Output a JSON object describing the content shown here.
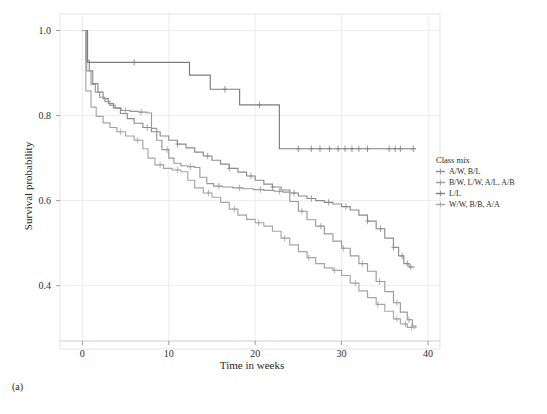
{
  "panel": {
    "label": "(a)"
  },
  "chart_data": {
    "type": "line",
    "subtype": "kaplan-meier-survival-step",
    "title": "",
    "xlabel": "Time in weeks",
    "ylabel": "Survival probability",
    "xlim": [
      -1.2,
      40
    ],
    "ylim": [
      0.27,
      1.02
    ],
    "xticks": [
      0,
      10,
      20,
      30,
      40
    ],
    "xtick_labels": [
      "0",
      "10",
      "20",
      "30",
      "40"
    ],
    "yticks": [
      0.4,
      0.6,
      0.8,
      1.0
    ],
    "ytick_labels": [
      "0.4",
      "0.6",
      "0.8",
      "1.0"
    ],
    "grid": true,
    "grid_color": "#e9e9ea",
    "legend_position": "right-outside",
    "legend_title": "Class mix",
    "series": [
      {
        "name": "A/W, B/L",
        "color": "#8c8c8c",
        "points": [
          [
            0,
            1.0
          ],
          [
            0.4,
            0.93
          ],
          [
            0.8,
            0.905
          ],
          [
            1.2,
            0.875
          ],
          [
            1.8,
            0.855
          ],
          [
            2.4,
            0.84
          ],
          [
            3.0,
            0.828
          ],
          [
            3.6,
            0.818
          ],
          [
            4.4,
            0.805
          ],
          [
            5.2,
            0.793
          ],
          [
            6.0,
            0.782
          ],
          [
            7.0,
            0.772
          ],
          [
            8.0,
            0.762
          ],
          [
            9.0,
            0.752
          ],
          [
            10.0,
            0.742
          ],
          [
            11.0,
            0.733
          ],
          [
            12.0,
            0.724
          ],
          [
            13.0,
            0.714
          ],
          [
            14.0,
            0.705
          ],
          [
            15.0,
            0.695
          ],
          [
            16.0,
            0.686
          ],
          [
            17.0,
            0.676
          ],
          [
            18.0,
            0.667
          ],
          [
            19.0,
            0.658
          ],
          [
            20.0,
            0.648
          ],
          [
            21.0,
            0.639
          ],
          [
            22.0,
            0.632
          ],
          [
            23.0,
            0.625
          ],
          [
            24.0,
            0.618
          ],
          [
            25.0,
            0.611
          ],
          [
            26.0,
            0.605
          ],
          [
            27.0,
            0.6
          ],
          [
            28.0,
            0.596
          ],
          [
            29.0,
            0.592
          ],
          [
            30.0,
            0.586
          ],
          [
            31.0,
            0.578
          ],
          [
            32.0,
            0.566
          ],
          [
            33.0,
            0.552
          ],
          [
            34.0,
            0.534
          ],
          [
            35.0,
            0.512
          ],
          [
            36.0,
            0.49
          ],
          [
            36.6,
            0.47
          ],
          [
            37.2,
            0.452
          ],
          [
            37.8,
            0.444
          ],
          [
            38.4,
            0.443
          ]
        ],
        "censor_times": [
          7.5,
          11.0,
          14.5,
          17.0,
          19.5,
          22.0,
          24.5,
          26.5,
          28.5,
          30.5,
          33.0,
          34.5,
          36.0,
          37.0,
          37.6,
          38.0
        ]
      },
      {
        "name": "B/W, L/W, A/L, A/B",
        "color": "#9a9a9a",
        "points": [
          [
            0,
            1.0
          ],
          [
            0.5,
            0.905
          ],
          [
            1.0,
            0.873
          ],
          [
            1.5,
            0.855
          ],
          [
            2.0,
            0.843
          ],
          [
            2.6,
            0.833
          ],
          [
            3.2,
            0.824
          ],
          [
            3.8,
            0.817
          ],
          [
            4.5,
            0.812
          ],
          [
            5.5,
            0.81
          ],
          [
            6.5,
            0.808
          ],
          [
            7.5,
            0.806
          ],
          [
            8.0,
            0.77
          ],
          [
            8.6,
            0.742
          ],
          [
            9.2,
            0.72
          ],
          [
            10.0,
            0.7
          ],
          [
            10.6,
            0.688
          ],
          [
            11.4,
            0.682
          ],
          [
            12.2,
            0.68
          ],
          [
            13.0,
            0.678
          ],
          [
            13.6,
            0.655
          ],
          [
            14.4,
            0.64
          ],
          [
            15.2,
            0.634
          ],
          [
            16.2,
            0.632
          ],
          [
            17.4,
            0.63
          ],
          [
            18.6,
            0.628
          ],
          [
            19.8,
            0.626
          ],
          [
            21.0,
            0.624
          ],
          [
            22.2,
            0.622
          ],
          [
            23.2,
            0.62
          ],
          [
            24.0,
            0.598
          ],
          [
            25.0,
            0.575
          ],
          [
            26.0,
            0.555
          ],
          [
            27.0,
            0.54
          ],
          [
            28.0,
            0.522
          ],
          [
            29.0,
            0.505
          ],
          [
            30.0,
            0.488
          ],
          [
            31.0,
            0.47
          ],
          [
            32.0,
            0.452
          ],
          [
            33.0,
            0.434
          ],
          [
            34.0,
            0.41
          ],
          [
            35.0,
            0.386
          ],
          [
            36.0,
            0.36
          ],
          [
            36.8,
            0.338
          ],
          [
            37.6,
            0.32
          ],
          [
            38.2,
            0.305
          ],
          [
            38.6,
            0.3
          ]
        ],
        "censor_times": [
          5.0,
          6.8,
          9.8,
          12.5,
          15.8,
          18.2,
          20.6,
          22.8,
          25.4,
          27.6,
          30.2,
          32.4,
          34.4,
          36.4,
          37.8
        ]
      },
      {
        "name": "L/L",
        "color": "#7d7d7d",
        "points": [
          [
            0,
            1.0
          ],
          [
            0.6,
            0.925
          ],
          [
            12.0,
            0.925
          ],
          [
            12.4,
            0.895
          ],
          [
            14.4,
            0.895
          ],
          [
            14.8,
            0.862
          ],
          [
            17.8,
            0.862
          ],
          [
            18.2,
            0.825
          ],
          [
            22.4,
            0.825
          ],
          [
            22.8,
            0.722
          ],
          [
            38.6,
            0.722
          ]
        ],
        "censor_times": [
          6.0,
          16.5,
          20.5,
          25.0,
          26.5,
          27.5,
          28.6,
          29.6,
          30.4,
          31.2,
          32.0,
          33.0,
          35.5,
          36.2,
          36.8,
          38.3
        ]
      },
      {
        "name": "W/W, B/B, A/A",
        "color": "#a5a5a5",
        "points": [
          [
            0,
            1.0
          ],
          [
            0.4,
            0.858
          ],
          [
            1.0,
            0.82
          ],
          [
            1.6,
            0.798
          ],
          [
            2.4,
            0.783
          ],
          [
            3.2,
            0.772
          ],
          [
            4.0,
            0.762
          ],
          [
            5.0,
            0.752
          ],
          [
            6.0,
            0.742
          ],
          [
            7.0,
            0.722
          ],
          [
            7.6,
            0.7
          ],
          [
            8.4,
            0.684
          ],
          [
            9.4,
            0.676
          ],
          [
            10.4,
            0.672
          ],
          [
            11.4,
            0.668
          ],
          [
            12.2,
            0.648
          ],
          [
            13.0,
            0.63
          ],
          [
            14.0,
            0.618
          ],
          [
            15.0,
            0.608
          ],
          [
            16.0,
            0.596
          ],
          [
            17.0,
            0.58
          ],
          [
            18.0,
            0.566
          ],
          [
            19.0,
            0.556
          ],
          [
            20.0,
            0.548
          ],
          [
            21.0,
            0.54
          ],
          [
            22.0,
            0.528
          ],
          [
            23.0,
            0.512
          ],
          [
            24.0,
            0.496
          ],
          [
            25.0,
            0.48
          ],
          [
            26.0,
            0.466
          ],
          [
            27.0,
            0.452
          ],
          [
            28.0,
            0.442
          ],
          [
            29.0,
            0.436
          ],
          [
            30.0,
            0.424
          ],
          [
            31.0,
            0.406
          ],
          [
            32.0,
            0.388
          ],
          [
            33.0,
            0.372
          ],
          [
            34.0,
            0.356
          ],
          [
            35.0,
            0.34
          ],
          [
            36.0,
            0.322
          ],
          [
            36.8,
            0.31
          ],
          [
            37.6,
            0.302
          ],
          [
            38.4,
            0.298
          ]
        ],
        "censor_times": [
          4.4,
          6.4,
          9.0,
          11.0,
          14.6,
          17.6,
          20.4,
          23.4,
          26.2,
          29.2,
          31.6,
          34.2,
          36.4,
          37.4,
          38.1
        ]
      }
    ]
  }
}
